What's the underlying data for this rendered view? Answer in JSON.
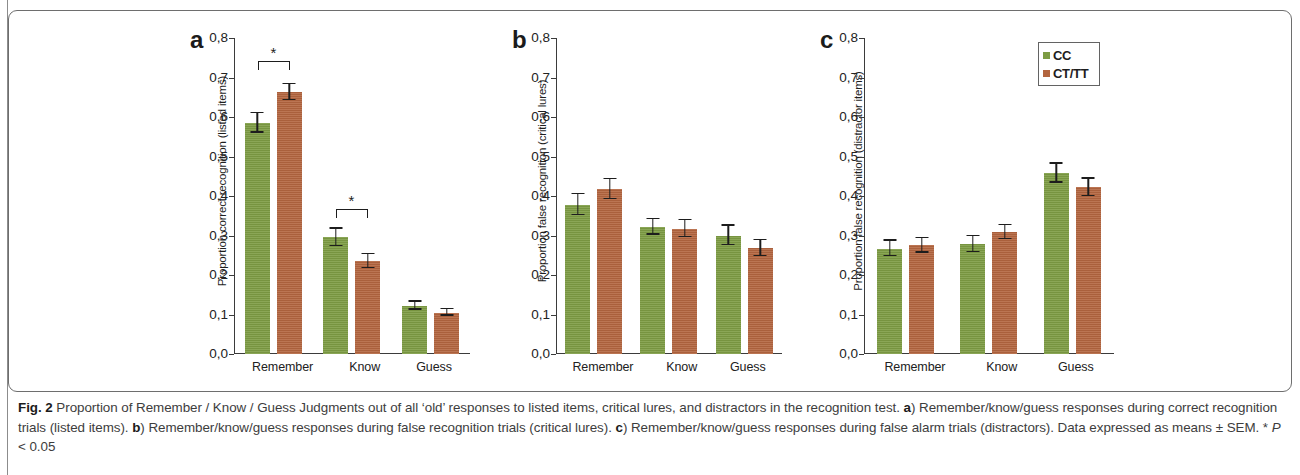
{
  "figure": {
    "caption_label": "Fig. 2",
    "caption_text": " Proportion of Remember / Know / Guess Judgments out of all ‘old’ responses to listed items, critical lures, and distractors in the recognition test. ",
    "caption_a_tag": "a",
    "caption_a_text": ") Remember/know/guess responses during correct recognition trials (listed items). ",
    "caption_b_tag": "b",
    "caption_b_text": ") Remember/know/guess responses during false recognition trials (critical lures). ",
    "caption_c_tag": "c",
    "caption_c_text": ") Remember/know/guess responses during false alarm trials (distractors). Data expressed as means ± SEM. * ",
    "caption_p_italic": "P",
    "caption_p_rest": " < 0.05"
  },
  "legend": {
    "title": "legend",
    "entries": [
      {
        "label": "CC",
        "color": "#7d9c43"
      },
      {
        "label": "CT/TT",
        "color": "#b3653f"
      }
    ]
  },
  "chart_data": [
    {
      "type": "bar",
      "panel": "a",
      "title": "a",
      "ylabel": "Proportion correct recognition (listed items)",
      "xlabel": "",
      "categories": [
        "Remember",
        "Know",
        "Guess"
      ],
      "ylim": [
        0,
        0.8
      ],
      "yticks": [
        "0,0",
        "0,1",
        "0,2",
        "0,3",
        "0,4",
        "0,5",
        "0,6",
        "0,7",
        "0,8"
      ],
      "grid": false,
      "legend_position": "none",
      "series": [
        {
          "name": "CC",
          "color": "#7d9c43",
          "values": [
            0.585,
            0.295,
            0.122
          ],
          "errors": [
            0.025,
            0.022,
            0.01
          ]
        },
        {
          "name": "CT/TT",
          "color": "#b3653f",
          "values": [
            0.663,
            0.235,
            0.105
          ],
          "errors": [
            0.02,
            0.018,
            0.008
          ]
        }
      ],
      "annotations": [
        {
          "type": "significance-bracket",
          "category": "Remember",
          "symbol": "*",
          "top_value": 0.742
        },
        {
          "type": "significance-bracket",
          "category": "Know",
          "symbol": "*",
          "top_value": 0.368
        }
      ]
    },
    {
      "type": "bar",
      "panel": "b",
      "title": "b",
      "ylabel": "Proportion false recognition (critical lures)",
      "xlabel": "",
      "categories": [
        "Remember",
        "Know",
        "Guess"
      ],
      "ylim": [
        0,
        0.8
      ],
      "yticks": [
        "0,0",
        "0,1",
        "0,2",
        "0,3",
        "0,4",
        "0,5",
        "0,6",
        "0,7",
        "0,8"
      ],
      "grid": false,
      "legend_position": "none",
      "series": [
        {
          "name": "CC",
          "color": "#7d9c43",
          "values": [
            0.378,
            0.322,
            0.3
          ],
          "errors": [
            0.026,
            0.02,
            0.025
          ]
        },
        {
          "name": "CT/TT",
          "color": "#b3653f",
          "values": [
            0.417,
            0.317,
            0.268
          ],
          "errors": [
            0.025,
            0.022,
            0.02
          ]
        }
      ],
      "annotations": []
    },
    {
      "type": "bar",
      "panel": "c",
      "title": "c",
      "ylabel": "Proportion false recognition (distractor items)",
      "xlabel": "",
      "categories": [
        "Remember",
        "Know",
        "Guess"
      ],
      "ylim": [
        0,
        0.8
      ],
      "yticks": [
        "0,0",
        "0,1",
        "0,2",
        "0,3",
        "0,4",
        "0,5",
        "0,6",
        "0,7",
        "0,8"
      ],
      "grid": false,
      "legend_position": "top-right",
      "series": [
        {
          "name": "CC",
          "color": "#7d9c43",
          "values": [
            0.267,
            0.278,
            0.458
          ],
          "errors": [
            0.02,
            0.02,
            0.024
          ]
        },
        {
          "name": "CT/TT",
          "color": "#b3653f",
          "values": [
            0.275,
            0.308,
            0.422
          ],
          "errors": [
            0.018,
            0.018,
            0.022
          ]
        }
      ],
      "annotations": []
    }
  ]
}
